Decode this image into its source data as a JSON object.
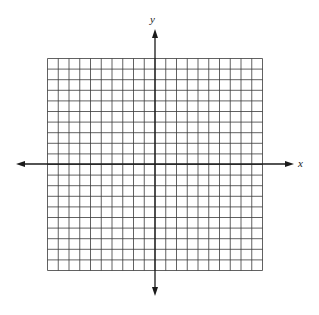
{
  "chart_data": {
    "type": "coordinate-grid",
    "title": "",
    "xlabel": "x",
    "ylabel": "y",
    "columns": 20,
    "rows": 20,
    "xlim": [
      -10,
      10
    ],
    "ylim": [
      -10,
      10
    ],
    "grid": true,
    "tick_labels": false,
    "axis_arrows": true
  },
  "colors": {
    "grid": "#3a3a3a",
    "axis": "#1a1a1a",
    "background": "#ffffff"
  },
  "labels": {
    "x_axis": "x",
    "y_axis": "y"
  }
}
